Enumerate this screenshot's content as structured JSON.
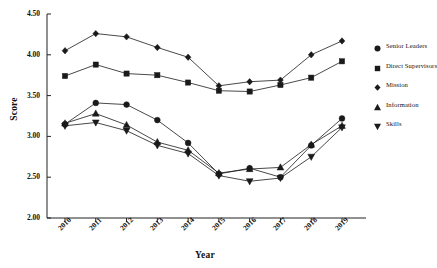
{
  "chart_data": {
    "type": "line",
    "title": "",
    "xlabel": "Year",
    "ylabel": "Score",
    "categories": [
      "2010",
      "2011",
      "2012",
      "2013",
      "2014",
      "2015",
      "2016",
      "2017",
      "2018",
      "2019"
    ],
    "ylim": [
      2.0,
      4.5
    ],
    "ytick_labels": [
      "2.00",
      "2.50",
      "3.00",
      "3.50",
      "4.00",
      "4.50"
    ],
    "ytick_values": [
      2.0,
      2.5,
      3.0,
      3.5,
      4.0,
      4.5
    ],
    "grid": false,
    "legend_position": "right",
    "line_color": "#1a1a1a",
    "series": [
      {
        "name": "Senior Leaders",
        "marker": "circle",
        "color": "#1a1a1a",
        "values": [
          3.15,
          3.41,
          3.39,
          3.2,
          2.92,
          2.54,
          2.61,
          2.5,
          2.89,
          3.22
        ]
      },
      {
        "name": "Direct Supervisors",
        "marker": "square",
        "color": "#1a1a1a",
        "values": [
          3.74,
          3.88,
          3.77,
          3.75,
          3.66,
          3.56,
          3.55,
          3.63,
          3.72,
          3.92
        ]
      },
      {
        "name": "Mission",
        "marker": "diamond",
        "color": "#1a1a1a",
        "values": [
          4.05,
          4.26,
          4.22,
          4.09,
          3.97,
          3.62,
          3.67,
          3.69,
          4.0,
          4.17
        ]
      },
      {
        "name": "Information",
        "marker": "triangle-up",
        "color": "#1a1a1a",
        "values": [
          3.16,
          3.28,
          3.14,
          2.93,
          2.83,
          2.55,
          2.6,
          2.62,
          2.9,
          3.13
        ]
      },
      {
        "name": "Skills",
        "marker": "triangle-down",
        "color": "#1a1a1a",
        "values": [
          3.13,
          3.17,
          3.07,
          2.89,
          2.79,
          2.52,
          2.45,
          2.49,
          2.75,
          3.11
        ]
      }
    ]
  }
}
